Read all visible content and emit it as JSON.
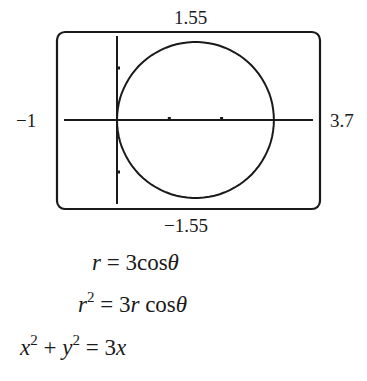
{
  "chart_data": {
    "type": "line",
    "subtype": "polar-parametric",
    "title": "",
    "window": {
      "xmin": -1,
      "xmax": 3.7,
      "ymin": -1.55,
      "ymax": 1.55
    },
    "tick_labels": {
      "top": "1.55",
      "bottom": "−1.55",
      "left": "−1",
      "right": "3.7"
    },
    "x_ticks": [
      1,
      2
    ],
    "y_ticks": [
      -1,
      1
    ],
    "series": [
      {
        "name": "r = 3cosθ",
        "shape": "circle",
        "center": [
          1.5,
          0
        ],
        "radius": 1.5
      }
    ],
    "grid": false,
    "legend": null,
    "xlabel": "",
    "ylabel": ""
  },
  "equations": {
    "line1": {
      "lhs": "r",
      "eq": " = 3cos",
      "theta": "θ"
    },
    "line2": {
      "lhs": "r",
      "exp": "2",
      "eq": " = 3",
      "r": "r",
      "cos": " cos",
      "theta": "θ"
    },
    "line3": {
      "x": "x",
      "exp_x": "2",
      "plus": " + ",
      "y": "y",
      "exp_y": "2",
      "eq": " = 3",
      "x2": "x"
    }
  },
  "colors": {
    "ink": "#1a1a1a",
    "background": "#ffffff"
  }
}
